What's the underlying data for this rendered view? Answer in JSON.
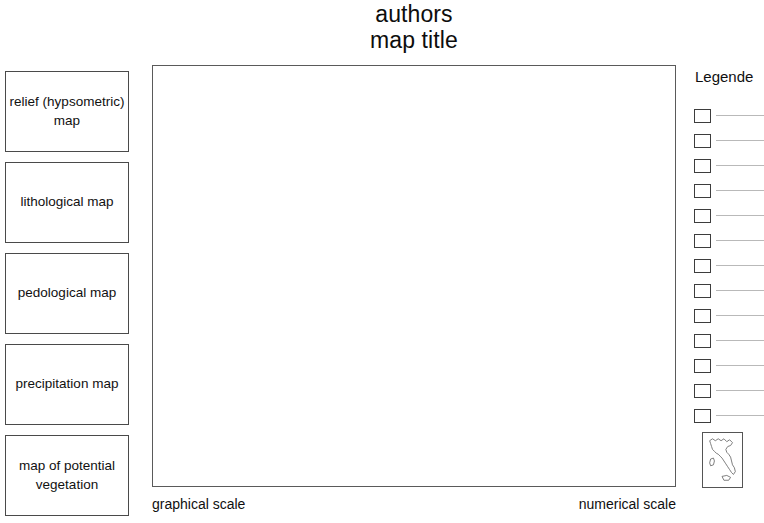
{
  "title": {
    "authors": "authors",
    "map_title": "map title"
  },
  "sidebar": {
    "items": [
      {
        "label": "relief (hypsometric) map"
      },
      {
        "label": "lithological map"
      },
      {
        "label": "pedological map"
      },
      {
        "label": "precipitation map"
      },
      {
        "label": "map of potential vegetation"
      }
    ]
  },
  "map": {
    "content": ""
  },
  "scales": {
    "graphical": "graphical scale",
    "numerical": "numerical scale"
  },
  "legend": {
    "heading": "Legende",
    "entries": [
      {
        "label": ""
      },
      {
        "label": ""
      },
      {
        "label": ""
      },
      {
        "label": ""
      },
      {
        "label": ""
      },
      {
        "label": ""
      },
      {
        "label": ""
      },
      {
        "label": ""
      },
      {
        "label": ""
      },
      {
        "label": ""
      },
      {
        "label": ""
      },
      {
        "label": ""
      },
      {
        "label": ""
      }
    ]
  },
  "inset": {
    "region": "Italy"
  },
  "colors": {
    "border": "#4a4a4a",
    "map_border": "#5a5a5a",
    "legend_line": "#b9b9b9",
    "text": "#0f0f0f",
    "background": "#ffffff"
  }
}
